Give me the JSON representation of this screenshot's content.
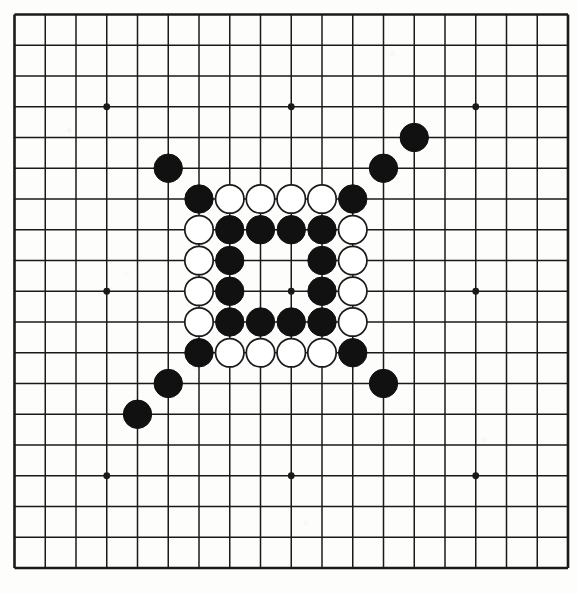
{
  "figure": {
    "kind": "go-board-diagram",
    "title": "",
    "caption": ""
  },
  "board": {
    "size": 19,
    "columns": 19,
    "rows": 19,
    "origin_x": 14.5,
    "origin_y": 14.5,
    "cell": 30.75,
    "line_color": "#1a1a1a",
    "border_line_width": 2.6,
    "inner_line_width": 1.5,
    "background_color": "#fdfdfb",
    "star_point_radius": 3.4,
    "star_points": [
      {
        "col": 3,
        "row": 3
      },
      {
        "col": 9,
        "row": 3
      },
      {
        "col": 15,
        "row": 3
      },
      {
        "col": 3,
        "row": 9
      },
      {
        "col": 9,
        "row": 9
      },
      {
        "col": 15,
        "row": 9
      },
      {
        "col": 3,
        "row": 15
      },
      {
        "col": 9,
        "row": 15
      },
      {
        "col": 15,
        "row": 15
      }
    ]
  },
  "stones": {
    "radius": 14.2,
    "black_fill": "#111111",
    "black_stroke": "#111111",
    "white_fill": "#ffffff",
    "white_stroke": "#1a1a1a",
    "white_stroke_width": 1.7,
    "black_count": 27,
    "white_count": 16,
    "total_count": 43,
    "list": [
      {
        "color": "black",
        "col": 13,
        "row": 4
      },
      {
        "color": "black",
        "col": 12,
        "row": 5
      },
      {
        "color": "black",
        "col": 5,
        "row": 5
      },
      {
        "color": "black",
        "col": 6,
        "row": 6
      },
      {
        "color": "white",
        "col": 7,
        "row": 6
      },
      {
        "color": "white",
        "col": 8,
        "row": 6
      },
      {
        "color": "white",
        "col": 9,
        "row": 6
      },
      {
        "color": "white",
        "col": 10,
        "row": 6
      },
      {
        "color": "black",
        "col": 11,
        "row": 6
      },
      {
        "color": "white",
        "col": 6,
        "row": 7
      },
      {
        "color": "black",
        "col": 7,
        "row": 7
      },
      {
        "color": "black",
        "col": 8,
        "row": 7
      },
      {
        "color": "black",
        "col": 9,
        "row": 7
      },
      {
        "color": "black",
        "col": 10,
        "row": 7
      },
      {
        "color": "white",
        "col": 11,
        "row": 7
      },
      {
        "color": "white",
        "col": 6,
        "row": 8
      },
      {
        "color": "black",
        "col": 7,
        "row": 8
      },
      {
        "color": "black",
        "col": 10,
        "row": 8
      },
      {
        "color": "white",
        "col": 11,
        "row": 8
      },
      {
        "color": "white",
        "col": 6,
        "row": 9
      },
      {
        "color": "black",
        "col": 7,
        "row": 9
      },
      {
        "color": "black",
        "col": 10,
        "row": 9
      },
      {
        "color": "white",
        "col": 11,
        "row": 9
      },
      {
        "color": "white",
        "col": 6,
        "row": 10
      },
      {
        "color": "black",
        "col": 7,
        "row": 10
      },
      {
        "color": "black",
        "col": 8,
        "row": 10
      },
      {
        "color": "black",
        "col": 9,
        "row": 10
      },
      {
        "color": "black",
        "col": 10,
        "row": 10
      },
      {
        "color": "white",
        "col": 11,
        "row": 10
      },
      {
        "color": "black",
        "col": 6,
        "row": 11
      },
      {
        "color": "white",
        "col": 7,
        "row": 11
      },
      {
        "color": "white",
        "col": 8,
        "row": 11
      },
      {
        "color": "white",
        "col": 9,
        "row": 11
      },
      {
        "color": "white",
        "col": 10,
        "row": 11
      },
      {
        "color": "black",
        "col": 11,
        "row": 11
      },
      {
        "color": "black",
        "col": 5,
        "row": 12
      },
      {
        "color": "black",
        "col": 12,
        "row": 12
      },
      {
        "color": "black",
        "col": 4,
        "row": 13
      }
    ]
  }
}
